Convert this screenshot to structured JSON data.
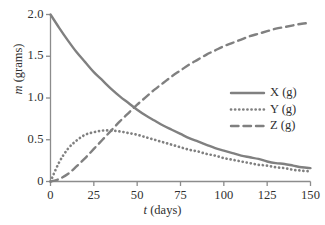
{
  "chart_data": {
    "type": "line",
    "title": "",
    "subtitle": "",
    "xlabel_math": "t",
    "xlabel_unit": "(days)",
    "ylabel_math": "m",
    "ylabel_unit": "(grams)",
    "xlim": [
      0,
      150
    ],
    "ylim": [
      0,
      2.0
    ],
    "xticks": [
      0,
      25,
      50,
      75,
      100,
      125,
      150
    ],
    "xtick_labels": [
      "0",
      "25",
      "50",
      "75",
      "100",
      "125",
      "150"
    ],
    "yticks": [
      0,
      0.5,
      1.0,
      1.5,
      2.0
    ],
    "ytick_labels": [
      "0",
      "0.5",
      "1.0",
      "1.5",
      "2.0"
    ],
    "grid": false,
    "legend_position": "center-right",
    "line_color": "#808080",
    "axis_color": "#8c8c8c",
    "text_color": "#2f2f2f",
    "series": [
      {
        "name": "X (g)",
        "style": "solid",
        "x": [
          0,
          5,
          10,
          15,
          20,
          25,
          30,
          35,
          40,
          45,
          50,
          55,
          60,
          65,
          70,
          75,
          80,
          85,
          90,
          95,
          100,
          105,
          110,
          115,
          120,
          125,
          130,
          135,
          140,
          145,
          150
        ],
        "values": [
          2.0,
          1.84,
          1.69,
          1.55,
          1.43,
          1.31,
          1.21,
          1.11,
          1.02,
          0.94,
          0.86,
          0.79,
          0.73,
          0.67,
          0.62,
          0.57,
          0.52,
          0.48,
          0.44,
          0.4,
          0.37,
          0.34,
          0.31,
          0.29,
          0.27,
          0.24,
          0.22,
          0.21,
          0.19,
          0.17,
          0.16
        ]
      },
      {
        "name": "Y (g)",
        "style": "dotted",
        "x": [
          0,
          5,
          10,
          15,
          20,
          25,
          30,
          35,
          40,
          45,
          50,
          55,
          60,
          65,
          70,
          75,
          80,
          85,
          90,
          95,
          100,
          105,
          110,
          115,
          120,
          125,
          130,
          135,
          140,
          145,
          150
        ],
        "values": [
          0.0,
          0.23,
          0.39,
          0.49,
          0.56,
          0.59,
          0.61,
          0.61,
          0.6,
          0.58,
          0.56,
          0.53,
          0.5,
          0.47,
          0.44,
          0.41,
          0.38,
          0.36,
          0.33,
          0.31,
          0.28,
          0.26,
          0.24,
          0.22,
          0.2,
          0.19,
          0.17,
          0.16,
          0.14,
          0.13,
          0.12
        ]
      },
      {
        "name": "Z (g)",
        "style": "dashed",
        "x": [
          0,
          5,
          10,
          15,
          20,
          25,
          30,
          35,
          40,
          45,
          50,
          55,
          60,
          65,
          70,
          75,
          80,
          85,
          90,
          95,
          100,
          105,
          110,
          115,
          120,
          125,
          130,
          135,
          140,
          145,
          150
        ],
        "values": [
          0.0,
          0.03,
          0.09,
          0.18,
          0.28,
          0.39,
          0.5,
          0.61,
          0.72,
          0.82,
          0.92,
          1.01,
          1.1,
          1.18,
          1.26,
          1.33,
          1.4,
          1.46,
          1.52,
          1.57,
          1.62,
          1.66,
          1.7,
          1.74,
          1.77,
          1.8,
          1.83,
          1.85,
          1.87,
          1.89,
          1.9
        ]
      }
    ]
  },
  "legend": {
    "entries": [
      {
        "label": "X (g)",
        "style": "solid"
      },
      {
        "label": "Y (g)",
        "style": "dotted"
      },
      {
        "label": "Z (g)",
        "style": "dashed"
      }
    ]
  }
}
